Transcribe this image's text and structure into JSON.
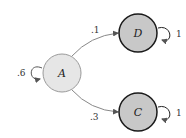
{
  "diagram": {
    "type": "markov-chain-state-diagram",
    "nodes": [
      {
        "id": "A",
        "label": "A",
        "fill": "#e6e6e6",
        "stroke": "#9a9a9a",
        "absorbing": false
      },
      {
        "id": "D",
        "label": "D",
        "fill": "#c8c8c8",
        "stroke": "#1a1a1a",
        "absorbing": true
      },
      {
        "id": "C",
        "label": "C",
        "fill": "#c8c8c8",
        "stroke": "#1a1a1a",
        "absorbing": true
      }
    ],
    "edges": [
      {
        "from": "A",
        "to": "A",
        "label": ".6"
      },
      {
        "from": "A",
        "to": "D",
        "label": ".1"
      },
      {
        "from": "A",
        "to": "C",
        "label": ".3"
      },
      {
        "from": "D",
        "to": "D",
        "label": "1"
      },
      {
        "from": "C",
        "to": "C",
        "label": "1"
      }
    ]
  }
}
